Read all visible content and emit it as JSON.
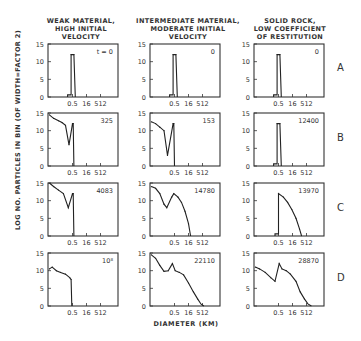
{
  "chart_data": {
    "type": "line",
    "title": "",
    "xlabel": "DIAMETER (KM)",
    "ylabel": "LOG NO. PARTICLES IN BIN (OF WIDTH=FACTOR 2)",
    "ylim": [
      0,
      15
    ],
    "yticks": [
      0,
      5,
      10,
      15
    ],
    "xticks": [
      "0.5",
      "16",
      "512"
    ],
    "columns": [
      "WEAK MATERIAL, HIGH INITIAL VELOCITY",
      "INTERMEDIATE MATERIAL, MODERATE INITIAL VELOCITY",
      "SOLID ROCK, LOW COEFFICIENT OF RESTITUTION"
    ],
    "rows": [
      "A",
      "B",
      "C",
      "D"
    ],
    "panels": [
      {
        "row": "A",
        "col": 0,
        "label": "t = 0",
        "points": [
          [
            0.28,
            0
          ],
          [
            0.28,
            0.6
          ],
          [
            0.33,
            0.6
          ],
          [
            0.33,
            12
          ],
          [
            0.37,
            12
          ],
          [
            0.39,
            0
          ]
        ]
      },
      {
        "row": "A",
        "col": 1,
        "label": "0",
        "points": [
          [
            0.28,
            0
          ],
          [
            0.28,
            0.6
          ],
          [
            0.33,
            0.6
          ],
          [
            0.33,
            12
          ],
          [
            0.37,
            12
          ],
          [
            0.39,
            0
          ]
        ]
      },
      {
        "row": "A",
        "col": 2,
        "label": "0",
        "points": [
          [
            0.28,
            0
          ],
          [
            0.28,
            0.6
          ],
          [
            0.33,
            0.6
          ],
          [
            0.33,
            12
          ],
          [
            0.37,
            12
          ],
          [
            0.39,
            0
          ]
        ]
      },
      {
        "row": "B",
        "col": 0,
        "label": "325",
        "points": [
          [
            0.02,
            14.5
          ],
          [
            0.08,
            13.5
          ],
          [
            0.15,
            12.8
          ],
          [
            0.2,
            12.3
          ],
          [
            0.25,
            11.5
          ],
          [
            0.3,
            6
          ],
          [
            0.35,
            12
          ],
          [
            0.36,
            12
          ],
          [
            0.37,
            0
          ]
        ]
      },
      {
        "row": "B",
        "col": 1,
        "label": "153",
        "points": [
          [
            0.02,
            12.5
          ],
          [
            0.08,
            12
          ],
          [
            0.14,
            11
          ],
          [
            0.2,
            10
          ],
          [
            0.25,
            3
          ],
          [
            0.33,
            12
          ],
          [
            0.34,
            12
          ],
          [
            0.35,
            0
          ]
        ]
      },
      {
        "row": "B",
        "col": 2,
        "label": "12400",
        "points": [
          [
            0.28,
            0
          ],
          [
            0.28,
            0.6
          ],
          [
            0.33,
            0.6
          ],
          [
            0.33,
            12
          ],
          [
            0.37,
            12
          ],
          [
            0.39,
            0
          ]
        ]
      },
      {
        "row": "C",
        "col": 0,
        "label": "4083",
        "points": [
          [
            0.02,
            15
          ],
          [
            0.08,
            14
          ],
          [
            0.15,
            13
          ],
          [
            0.22,
            12
          ],
          [
            0.29,
            8
          ],
          [
            0.35,
            12
          ],
          [
            0.36,
            12
          ],
          [
            0.37,
            0
          ]
        ]
      },
      {
        "row": "C",
        "col": 1,
        "label": "14780",
        "points": [
          [
            0.02,
            14
          ],
          [
            0.08,
            13.5
          ],
          [
            0.14,
            12
          ],
          [
            0.2,
            9
          ],
          [
            0.24,
            8
          ],
          [
            0.31,
            11
          ],
          [
            0.34,
            12
          ],
          [
            0.4,
            11
          ],
          [
            0.45,
            9.5
          ],
          [
            0.5,
            7
          ],
          [
            0.55,
            3.5
          ],
          [
            0.58,
            0
          ]
        ]
      },
      {
        "row": "C",
        "col": 2,
        "label": "13970",
        "points": [
          [
            0.3,
            0
          ],
          [
            0.3,
            0.6
          ],
          [
            0.35,
            0.6
          ],
          [
            0.35,
            12
          ],
          [
            0.42,
            11
          ],
          [
            0.48,
            9.5
          ],
          [
            0.54,
            7.5
          ],
          [
            0.6,
            5
          ],
          [
            0.65,
            2
          ],
          [
            0.68,
            0
          ]
        ]
      },
      {
        "row": "D",
        "col": 0,
        "label": "10⁸",
        "points": [
          [
            0.02,
            10.5
          ],
          [
            0.06,
            11
          ],
          [
            0.12,
            10
          ],
          [
            0.18,
            9.5
          ],
          [
            0.25,
            9
          ],
          [
            0.31,
            8
          ],
          [
            0.33,
            7.5
          ],
          [
            0.34,
            0
          ]
        ]
      },
      {
        "row": "D",
        "col": 1,
        "label": "22110",
        "points": [
          [
            0.02,
            14.5
          ],
          [
            0.08,
            13.5
          ],
          [
            0.14,
            11.5
          ],
          [
            0.2,
            9.8
          ],
          [
            0.26,
            10
          ],
          [
            0.32,
            12
          ],
          [
            0.36,
            10
          ],
          [
            0.42,
            9.5
          ],
          [
            0.48,
            8.8
          ],
          [
            0.55,
            6.5
          ],
          [
            0.62,
            4
          ],
          [
            0.68,
            2
          ],
          [
            0.73,
            0.5
          ],
          [
            0.77,
            0
          ]
        ]
      },
      {
        "row": "D",
        "col": 2,
        "label": "28870",
        "points": [
          [
            0.02,
            11
          ],
          [
            0.08,
            10.5
          ],
          [
            0.16,
            9.5
          ],
          [
            0.24,
            8
          ],
          [
            0.3,
            7
          ],
          [
            0.36,
            12
          ],
          [
            0.4,
            10.5
          ],
          [
            0.46,
            10
          ],
          [
            0.52,
            9
          ],
          [
            0.6,
            7
          ],
          [
            0.66,
            4
          ],
          [
            0.72,
            2
          ],
          [
            0.77,
            0.6
          ],
          [
            0.82,
            0
          ]
        ]
      }
    ]
  },
  "titles": {
    "col1_l1": "WEAK MATERIAL,",
    "col1_l2": "HIGH INITIAL",
    "col1_l3": "VELOCITY",
    "col2_l1": "INTERMEDIATE MATERIAL,",
    "col2_l2": "MODERATE INITIAL",
    "col2_l3": "VELOCITY",
    "col3_l1": "SOLID ROCK,",
    "col3_l2": "LOW COEFFICIENT",
    "col3_l3": "OF RESTITUTION"
  },
  "row_labels": {
    "a": "A",
    "b": "B",
    "c": "C",
    "d": "D"
  },
  "axes": {
    "ylabel": "LOG NO. PARTICLES IN BIN (OF WIDTH=FACTOR 2)",
    "xlabel": "DIAMETER (KM)"
  }
}
